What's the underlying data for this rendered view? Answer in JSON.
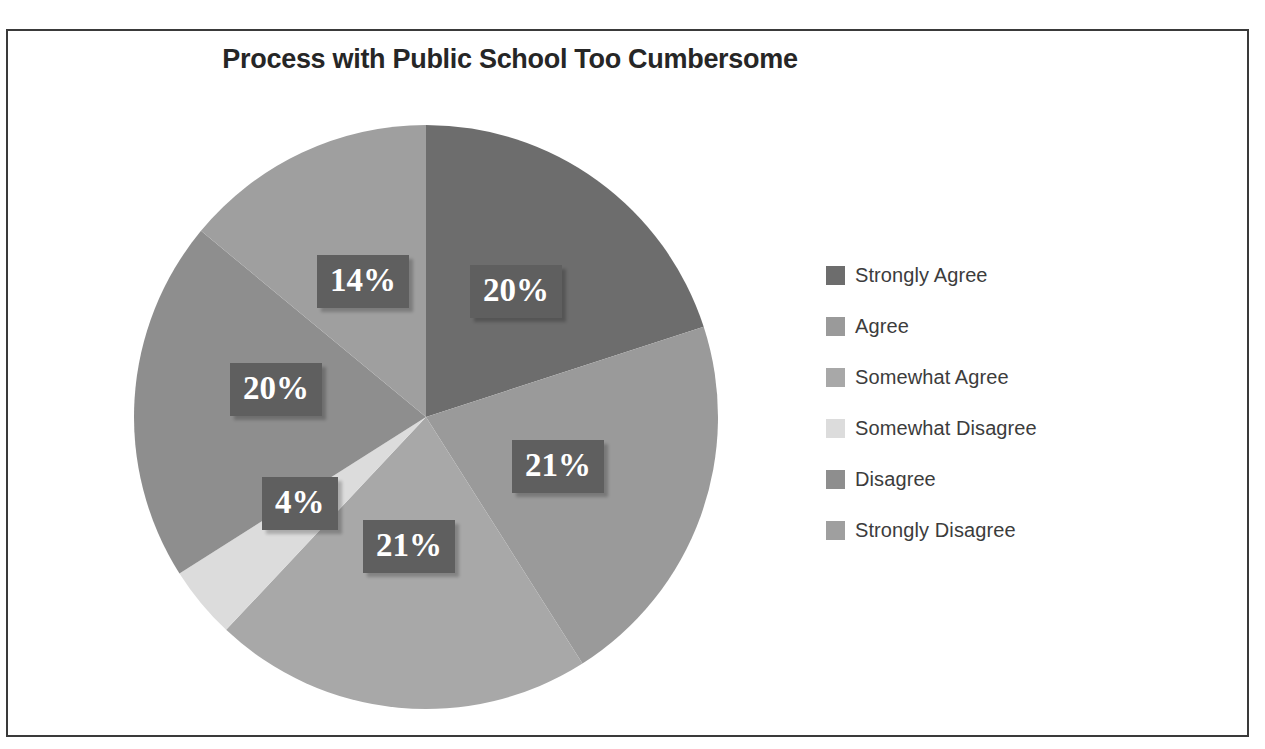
{
  "caption": {
    "text": "is too Cumbersome."
  },
  "frame": {
    "border_color": "#3a3a3a",
    "background": "#ffffff"
  },
  "chart_data": {
    "type": "pie",
    "title": "Process with Public School Too Cumbersome",
    "xlabel": "",
    "ylabel": "",
    "legend_position": "right",
    "grid": false,
    "start_angle_deg": 0,
    "direction": "clockwise",
    "categories": [
      "Strongly Agree",
      "Agree",
      "Somewhat Agree",
      "Somewhat Disagree",
      "Disagree",
      "Strongly Disagree"
    ],
    "values": [
      20,
      21,
      21,
      4,
      20,
      14
    ],
    "value_labels": [
      "20%",
      "21%",
      "21%",
      "4%",
      "20%",
      "14%"
    ],
    "colors": [
      "#6d6d6d",
      "#9a9a9a",
      "#a8a8a8",
      "#dcdcdc",
      "#8e8e8e",
      "#9f9f9f"
    ],
    "label_box_color": "#5f5f5f",
    "label_text_color": "#ffffff"
  },
  "pie": {
    "center_x": 426,
    "center_y": 417,
    "radius": 292,
    "labels": [
      {
        "text": "20%",
        "x": 470,
        "y": 265
      },
      {
        "text": "21%",
        "x": 512,
        "y": 440
      },
      {
        "text": "21%",
        "x": 363,
        "y": 520
      },
      {
        "text": "4%",
        "x": 262,
        "y": 477
      },
      {
        "text": "20%",
        "x": 230,
        "y": 363
      },
      {
        "text": "14%",
        "x": 317,
        "y": 255
      }
    ]
  },
  "legend": {
    "items": [
      {
        "label": "Strongly Agree",
        "color": "#6d6d6d"
      },
      {
        "label": "Agree",
        "color": "#9a9a9a"
      },
      {
        "label": "Somewhat Agree",
        "color": "#a8a8a8"
      },
      {
        "label": "Somewhat Disagree",
        "color": "#dcdcdc"
      },
      {
        "label": "Disagree",
        "color": "#8e8e8e"
      },
      {
        "label": "Strongly Disagree",
        "color": "#9f9f9f"
      }
    ]
  }
}
